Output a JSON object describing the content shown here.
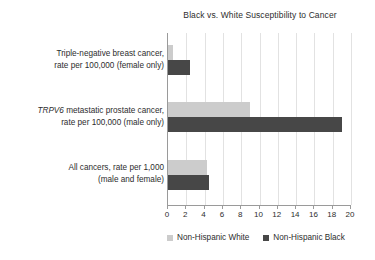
{
  "chart_data": {
    "type": "bar",
    "orientation": "horizontal",
    "title": "Black vs. White Susceptibility to Cancer",
    "xlabel": "",
    "ylabel": "",
    "xlim": [
      0,
      20
    ],
    "xticks": [
      0,
      2,
      4,
      6,
      8,
      10,
      12,
      14,
      16,
      18,
      20
    ],
    "grid": true,
    "legend_position": "bottom",
    "categories": [
      "Triple-negative breast cancer, rate per 100,000 (female only)",
      "TRPV6 metastatic prostate cancer, rate per 100,000 (male only)",
      "All cancers, rate per 1,000 (male and female)"
    ],
    "category_lines": [
      [
        "Triple-negative breast cancer,",
        "rate per 100,000 (female only)"
      ],
      [
        "TRPV6 metastatic prostate cancer,",
        "rate per 100,000 (male only)"
      ],
      [
        "All cancers, rate per 1,000",
        "(male and female)"
      ]
    ],
    "series": [
      {
        "name": "Non-Hispanic White",
        "color": "#cccccc",
        "values": [
          0.5,
          9.0,
          4.3
        ]
      },
      {
        "name": "Non-Hispanic Black",
        "color": "#474747",
        "values": [
          2.4,
          19.0,
          4.5
        ]
      }
    ]
  },
  "legend": [
    {
      "label": "Non-Hispanic White",
      "color": "#cccccc"
    },
    {
      "label": "Non-Hispanic Black",
      "color": "#474747"
    }
  ]
}
